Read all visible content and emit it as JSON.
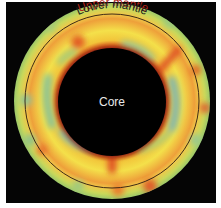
{
  "figure": {
    "labels": {
      "upper_mantle": "Upper mantle",
      "lower_mantle": "Lower mantle",
      "core": "Core"
    },
    "colors": {
      "background": "#050505",
      "frame": "#ffffff",
      "hot_red": "#d9401e",
      "orange": "#ec7a2a",
      "yellow": "#f3df3a",
      "green": "#9cc86a",
      "blue_green": "#7fb8a0",
      "core": "#000000",
      "upper_mantle_label": "#b0231a",
      "lower_mantle_label": "#1a1a1a",
      "core_label": "#e8e8e8"
    },
    "geometry": {
      "center": [
        112,
        101
      ],
      "outer_radius": 98,
      "boundary_radius": 87,
      "core_radius": 54
    }
  }
}
